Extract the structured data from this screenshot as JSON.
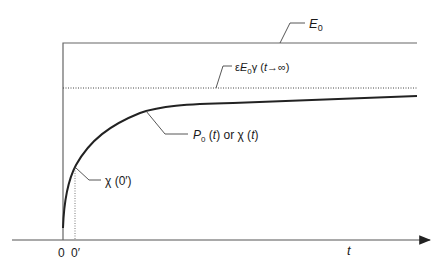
{
  "diagram": {
    "type": "polarization-vs-time",
    "labels": {
      "e0": "E",
      "e0_sub": "0",
      "eps_prefix": "ε",
      "eps_e": "E",
      "eps_sub": "0",
      "eps_suffix": "γ (",
      "eps_t": "t",
      "eps_end": "→∞)",
      "p0_p": "P",
      "p0_sub": "0",
      "p0_mid": " (",
      "p0_t": "t",
      "p0_or": ") or χ (",
      "p0_t2": "t",
      "p0_end": ")",
      "chi0": "χ (0′)",
      "tick_zero": "0",
      "tick_zero_prime": "0′",
      "axis_t": "t"
    },
    "colors": {
      "line": "#555555",
      "curve": "#222222",
      "text": "#1a1a1a"
    }
  }
}
